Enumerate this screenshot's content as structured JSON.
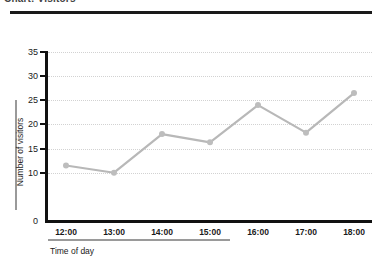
{
  "header": {
    "title": "Chart: Visitors",
    "rule_color": "#1a1a1a"
  },
  "axes": {
    "ylabel": "Number of visitors",
    "xlabel": "Time of day",
    "y_ticks": [
      35,
      30,
      25,
      20,
      15,
      10,
      0
    ],
    "x_ticks": [
      "12:00",
      "13:00",
      "14:00",
      "15:00",
      "16:00",
      "17:00",
      "18:00"
    ],
    "spine_color": "#111111",
    "grid_color": "#d2d2d2"
  },
  "chart_data": {
    "type": "line",
    "title": "Chart: Visitors",
    "xlabel": "Time of day",
    "ylabel": "Number of visitors",
    "categories": [
      "12:00",
      "13:00",
      "14:00",
      "15:00",
      "16:00",
      "17:00",
      "18:00"
    ],
    "values": [
      11.5,
      10,
      18,
      16.3,
      24,
      18.3,
      26.5
    ],
    "series": [
      {
        "name": "Number of visitors",
        "values": [
          11.5,
          10,
          18,
          16.3,
          24,
          18.3,
          26.5
        ],
        "color": "#b8b8b8",
        "marker": "circle"
      }
    ],
    "ylim": [
      0,
      35
    ],
    "y_ticks": [
      35,
      30,
      25,
      20,
      15,
      10,
      0
    ],
    "grid": true,
    "grid_axis": "y",
    "legend": false,
    "line_color": "#b8b8b8",
    "marker_color": "#bdbdbd"
  }
}
